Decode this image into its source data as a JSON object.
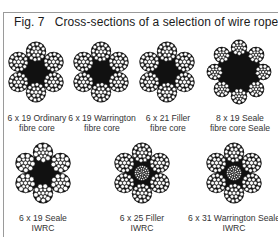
{
  "figure": {
    "label": "Fig. 7",
    "title": "Cross-sections of a selection of wire ropes"
  },
  "ropes": [
    {
      "type": "6 x 19 Ordinary",
      "core": "fibre core",
      "strands": 6,
      "style": "ordinary"
    },
    {
      "type": "6 x 19 Warrington",
      "core": "fibre core",
      "strands": 6,
      "style": "warrington"
    },
    {
      "type": "6 x 21 Filler",
      "core": "fibre core",
      "strands": 6,
      "style": "filler"
    },
    {
      "type": "8 x 19 Seale",
      "core": "fibre core Seale",
      "strands": 8,
      "style": "seale"
    },
    {
      "type": "6 x 19 Seale",
      "core": "IWRC",
      "strands": 6,
      "style": "seale"
    },
    {
      "type": "6 x 25 Filler",
      "core": "IWRC",
      "strands": 6,
      "style": "filler-iwrc"
    },
    {
      "type": "6 x 31 Warrington Seale",
      "core": "IWRC",
      "strands": 6,
      "style": "warrington-iwrc"
    }
  ]
}
